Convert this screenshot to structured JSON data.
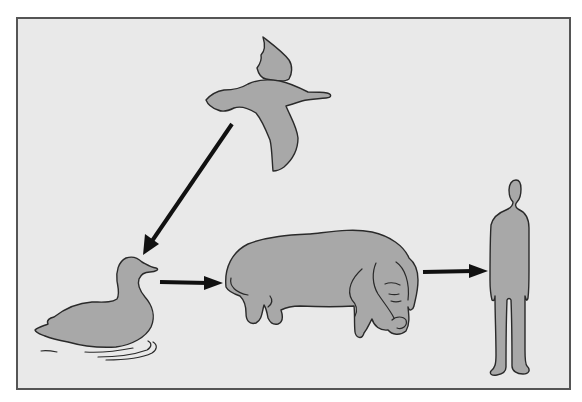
{
  "diagram": {
    "title": "",
    "colors": {
      "background": "#e9e9e9",
      "figure_fill": "#a8a8a8",
      "outline": "#2a2a2a",
      "arrow": "#111111",
      "frame": "#555555"
    },
    "nodes": [
      {
        "id": "wild-bird",
        "label": "Flying wild duck"
      },
      {
        "id": "domestic-duck",
        "label": "Swimming duck"
      },
      {
        "id": "pig",
        "label": "Pig"
      },
      {
        "id": "human",
        "label": "Human"
      }
    ],
    "edges": [
      {
        "from": "wild-bird",
        "to": "domestic-duck"
      },
      {
        "from": "domestic-duck",
        "to": "pig"
      },
      {
        "from": "pig",
        "to": "human"
      }
    ]
  }
}
